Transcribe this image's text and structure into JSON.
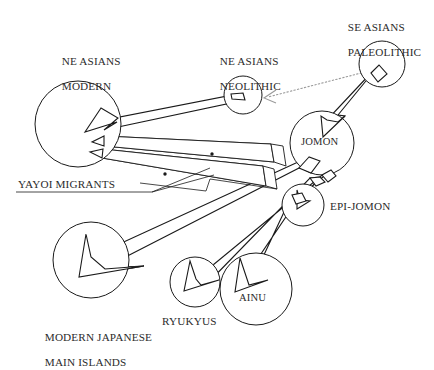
{
  "diagram": {
    "type": "population-migration-diagram",
    "background": "#ffffff",
    "ink_color": "#1a1a1a",
    "dotted_arrow_color": "#9a9a9a",
    "nodes": [
      {
        "id": "ne-asians-modern",
        "label": "NE ASIANS\nMODERN",
        "label_line1": "NE ASIANS",
        "label_line2": "MODERN",
        "cx": 78,
        "cy": 124,
        "r": 43,
        "label_pos": "above"
      },
      {
        "id": "ne-asians-neolithic",
        "label": "NE ASIANS\nNEOLITHIC",
        "label_line1": "NE ASIANS",
        "label_line2": "NEOLITHIC",
        "cx": 243,
        "cy": 95,
        "r": 19,
        "label_pos": "above"
      },
      {
        "id": "se-asians-paleolithic",
        "label": "SE ASIANS\nPALEOLITHIC",
        "label_line1": "SE ASIANS",
        "label_line2": "PALEOLITHIC",
        "cx": 382,
        "cy": 64,
        "r": 23,
        "label_pos": "above"
      },
      {
        "id": "jomon",
        "label": "JOMON",
        "cx": 322,
        "cy": 143,
        "r": 32,
        "label_pos": "inside"
      },
      {
        "id": "epi-jomon",
        "label": "EPI-JOMON",
        "cx": 303,
        "cy": 205,
        "r": 21,
        "label_pos": "right"
      },
      {
        "id": "ryukyus",
        "label": "RYUKYUS",
        "cx": 195,
        "cy": 282,
        "r": 25,
        "label_pos": "below"
      },
      {
        "id": "ainu",
        "label": "AINU",
        "cx": 256,
        "cy": 289,
        "r": 36,
        "label_pos": "inside"
      },
      {
        "id": "modern-japanese",
        "label": "MODERN JAPANESE\nMAIN ISLANDS",
        "label_line1": "MODERN JAPANESE",
        "label_line2": "MAIN ISLANDS",
        "cx": 91,
        "cy": 260,
        "r": 38,
        "label_pos": "below"
      }
    ],
    "annotations": [
      {
        "id": "yayoi-migrants",
        "label": "YAYOI MIGRANTS",
        "style": "underlined-with-leader-lines"
      }
    ],
    "edges": [
      {
        "id": "se-paleolithic-to-jomon",
        "from": "se-asians-paleolithic",
        "to": "jomon",
        "style": "solid-white-arrow"
      },
      {
        "id": "se-paleolithic-to-ne-neolithic",
        "from": "se-asians-paleolithic",
        "to": "ne-asians-neolithic",
        "style": "gray-dotted-arrow"
      },
      {
        "id": "ne-neolithic-to-ne-modern",
        "from": "ne-asians-neolithic",
        "to": "ne-asians-modern",
        "style": "solid-white-arrow"
      },
      {
        "id": "yayoi-band-upper",
        "from": "ne-asians-neolithic",
        "to": "ne-asians-modern",
        "style": "hatched-band-arrow",
        "annotation": "yayoi-migrants"
      },
      {
        "id": "yayoi-band-lower",
        "from": "jomon",
        "to": "ne-asians-modern",
        "style": "hatched-band-arrow",
        "annotation": "yayoi-migrants"
      },
      {
        "id": "jomon-to-modern-japanese",
        "from": "jomon",
        "to": "modern-japanese",
        "style": "solid-white-arrow"
      },
      {
        "id": "jomon-to-ryukyus",
        "from": "jomon",
        "to": "ryukyus",
        "style": "solid-white-arrow"
      },
      {
        "id": "jomon-to-epi-jomon",
        "from": "jomon",
        "to": "epi-jomon",
        "style": "solid-white-arrow"
      },
      {
        "id": "epi-jomon-to-ainu",
        "from": "epi-jomon",
        "to": "ainu",
        "style": "solid-white-arrow"
      }
    ]
  },
  "labels": {
    "ne_asians_modern_l1": "NE ASIANS",
    "ne_asians_modern_l2": "MODERN",
    "ne_asians_neolithic_l1": "NE ASIANS",
    "ne_asians_neolithic_l2": "NEOLITHIC",
    "se_asians_paleolithic_l1": "SE ASIANS",
    "se_asians_paleolithic_l2": "PALEOLITHIC",
    "jomon": "JOMON",
    "epi_jomon": "EPI-JOMON",
    "ryukyus": "RYUKYUS",
    "ainu": "AINU",
    "modern_japanese_l1": "MODERN JAPANESE",
    "modern_japanese_l2": "MAIN ISLANDS",
    "yayoi_migrants": "YAYOI MIGRANTS"
  }
}
